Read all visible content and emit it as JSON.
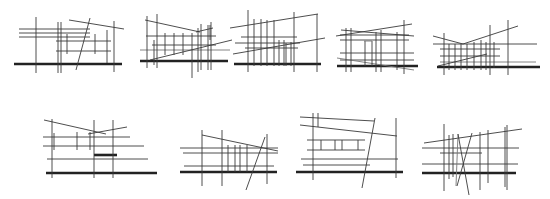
{
  "figure": {
    "width": 550,
    "height": 199,
    "background": "#ffffff",
    "panels": [
      {
        "id": "sketch-1",
        "lines": [
          [
            14,
            64,
            122,
            64,
            "thick"
          ],
          [
            19,
            29,
            90,
            29,
            "thin"
          ],
          [
            19,
            33,
            90,
            33,
            "thin"
          ],
          [
            19,
            37,
            90,
            37,
            "thin"
          ],
          [
            56,
            41,
            111,
            41,
            "thin"
          ],
          [
            56,
            51,
            111,
            51,
            "thin"
          ],
          [
            36,
            17,
            36,
            73,
            "thin"
          ],
          [
            58,
            22,
            58,
            73,
            "thin"
          ],
          [
            61,
            22,
            61,
            73,
            "thin"
          ],
          [
            67,
            34,
            67,
            54,
            "thin"
          ],
          [
            95,
            34,
            95,
            54,
            "thin"
          ],
          [
            107,
            30,
            107,
            63,
            "thin"
          ],
          [
            114,
            21,
            114,
            72,
            "thin"
          ],
          [
            69,
            20,
            124,
            29,
            "thin"
          ],
          [
            90,
            18,
            76,
            70,
            "thin"
          ]
        ]
      },
      {
        "id": "sketch-2",
        "lines": [
          [
            140,
            61,
            228,
            61,
            "thick"
          ],
          [
            146,
            36,
            216,
            36,
            "thin"
          ],
          [
            152,
            45,
            216,
            45,
            "thin"
          ],
          [
            140,
            50,
            230,
            50,
            "grey"
          ],
          [
            147,
            16,
            147,
            68,
            "thin"
          ],
          [
            157,
            14,
            157,
            68,
            "thin"
          ],
          [
            154,
            40,
            154,
            65,
            "thin"
          ],
          [
            165,
            33,
            165,
            55,
            "thin"
          ],
          [
            174,
            33,
            174,
            55,
            "thin"
          ],
          [
            183,
            33,
            183,
            55,
            "thin"
          ],
          [
            192,
            33,
            192,
            78,
            "thin"
          ],
          [
            198,
            28,
            198,
            72,
            "thin"
          ],
          [
            201,
            24,
            201,
            70,
            "thin"
          ],
          [
            208,
            25,
            208,
            70,
            "thin"
          ],
          [
            211,
            22,
            211,
            70,
            "thin"
          ],
          [
            210,
            25,
            210,
            40,
            "thin"
          ],
          [
            145,
            20,
            200,
            32,
            "thin"
          ],
          [
            196,
            32,
            213,
            28,
            "thin"
          ],
          [
            150,
            60,
            232,
            40,
            "thin"
          ]
        ]
      },
      {
        "id": "sketch-3",
        "lines": [
          [
            234,
            64,
            321,
            64,
            "thick"
          ],
          [
            230,
            28,
            318,
            14,
            "thin"
          ],
          [
            233,
            54,
            325,
            38,
            "thin"
          ],
          [
            241,
            37,
            297,
            37,
            "thin"
          ],
          [
            235,
            43,
            300,
            43,
            "thin"
          ],
          [
            245,
            48,
            298,
            48,
            "thin"
          ],
          [
            248,
            10,
            248,
            72,
            "thin"
          ],
          [
            254,
            19,
            254,
            66,
            "thin"
          ],
          [
            261,
            19,
            261,
            66,
            "thin"
          ],
          [
            267,
            20,
            267,
            66,
            "thin"
          ],
          [
            274,
            20,
            274,
            66,
            "thin"
          ],
          [
            279,
            40,
            279,
            66,
            "thin"
          ],
          [
            284,
            40,
            284,
            66,
            "thin"
          ],
          [
            286,
            43,
            286,
            66,
            "thin"
          ],
          [
            291,
            42,
            291,
            66,
            "thin"
          ],
          [
            294,
            12,
            294,
            72,
            "thin"
          ],
          [
            317,
            14,
            317,
            72,
            "thin"
          ]
        ]
      },
      {
        "id": "sketch-4",
        "lines": [
          [
            337,
            66,
            418,
            66,
            "thick"
          ],
          [
            336,
            36,
            412,
            24,
            "thin"
          ],
          [
            341,
            30,
            414,
            36,
            "thin"
          ],
          [
            340,
            35,
            409,
            35,
            "thin"
          ],
          [
            340,
            40,
            409,
            40,
            "thin"
          ],
          [
            340,
            53,
            414,
            53,
            "thin"
          ],
          [
            340,
            60,
            414,
            60,
            "thin"
          ],
          [
            337,
            58,
            414,
            70,
            "grey"
          ],
          [
            346,
            28,
            346,
            72,
            "thin"
          ],
          [
            351,
            28,
            351,
            72,
            "thin"
          ],
          [
            365,
            41,
            365,
            66,
            "thin"
          ],
          [
            372,
            41,
            372,
            66,
            "thin"
          ],
          [
            376,
            32,
            376,
            72,
            "thin"
          ],
          [
            381,
            30,
            381,
            72,
            "thin"
          ],
          [
            397,
            32,
            397,
            70,
            "thin"
          ],
          [
            404,
            20,
            404,
            74,
            "thin"
          ],
          [
            364,
            41,
            372,
            41,
            "grey"
          ]
        ]
      },
      {
        "id": "sketch-5",
        "lines": [
          [
            437,
            67,
            540,
            67,
            "thick"
          ],
          [
            433,
            36,
            463,
            44,
            "thin"
          ],
          [
            463,
            44,
            518,
            26,
            "thin"
          ],
          [
            433,
            44,
            537,
            44,
            "thin"
          ],
          [
            440,
            49,
            500,
            49,
            "thin"
          ],
          [
            440,
            56,
            500,
            56,
            "thin"
          ],
          [
            440,
            62,
            536,
            62,
            "grey"
          ],
          [
            438,
            66,
            487,
            54,
            "thin"
          ],
          [
            444,
            33,
            444,
            75,
            "thin"
          ],
          [
            449,
            44,
            449,
            70,
            "thin"
          ],
          [
            455,
            44,
            455,
            70,
            "thin"
          ],
          [
            461,
            44,
            461,
            70,
            "thin"
          ],
          [
            467,
            44,
            467,
            70,
            "thin"
          ],
          [
            474,
            42,
            474,
            70,
            "thin"
          ],
          [
            481,
            40,
            481,
            70,
            "thin"
          ],
          [
            486,
            42,
            486,
            70,
            "thin"
          ],
          [
            490,
            25,
            490,
            75,
            "thin"
          ],
          [
            494,
            42,
            494,
            68,
            "thin"
          ],
          [
            508,
            20,
            508,
            75,
            "thin"
          ]
        ]
      },
      {
        "id": "sketch-6",
        "lines": [
          [
            46,
            173,
            157,
            173,
            "thick"
          ],
          [
            44,
            120,
            106,
            134,
            "thin"
          ],
          [
            88,
            134,
            127,
            127,
            "thin"
          ],
          [
            43,
            137,
            130,
            137,
            "thin"
          ],
          [
            43,
            146,
            144,
            146,
            "thin"
          ],
          [
            47,
            159,
            148,
            159,
            "thin"
          ],
          [
            94,
            155,
            117,
            155,
            "thick"
          ],
          [
            52,
            119,
            52,
            178,
            "thin"
          ],
          [
            54,
            133,
            54,
            150,
            "thin"
          ],
          [
            77,
            132,
            77,
            150,
            "thin"
          ],
          [
            90,
            132,
            90,
            150,
            "thin"
          ],
          [
            94,
            120,
            94,
            178,
            "thin"
          ],
          [
            113,
            120,
            113,
            178,
            "thin"
          ]
        ]
      },
      {
        "id": "sketch-7",
        "lines": [
          [
            180,
            172,
            277,
            172,
            "thick"
          ],
          [
            202,
            135,
            278,
            151,
            "thin"
          ],
          [
            180,
            148,
            278,
            148,
            "thin"
          ],
          [
            183,
            153,
            278,
            153,
            "thin"
          ],
          [
            184,
            166,
            274,
            166,
            "thin"
          ],
          [
            202,
            130,
            202,
            186,
            "thin"
          ],
          [
            222,
            130,
            222,
            186,
            "thin"
          ],
          [
            228,
            145,
            228,
            172,
            "thin"
          ],
          [
            235,
            145,
            235,
            172,
            "thin"
          ],
          [
            240,
            145,
            240,
            172,
            "thin"
          ],
          [
            247,
            145,
            247,
            172,
            "thin"
          ],
          [
            265,
            137,
            246,
            190,
            "thin"
          ],
          [
            267,
            134,
            267,
            184,
            "thin"
          ]
        ]
      },
      {
        "id": "sketch-8",
        "lines": [
          [
            296,
            172,
            403,
            172,
            "thick"
          ],
          [
            300,
            117,
            374,
            121,
            "thin"
          ],
          [
            300,
            125,
            397,
            136,
            "thin"
          ],
          [
            307,
            140,
            365,
            140,
            "thin"
          ],
          [
            307,
            150,
            365,
            150,
            "thin"
          ],
          [
            301,
            159,
            398,
            159,
            "thin"
          ],
          [
            303,
            165,
            370,
            165,
            "thin"
          ],
          [
            313,
            113,
            313,
            180,
            "thin"
          ],
          [
            318,
            113,
            318,
            127,
            "thin"
          ],
          [
            321,
            140,
            321,
            150,
            "thin"
          ],
          [
            335,
            140,
            335,
            150,
            "thin"
          ],
          [
            342,
            140,
            342,
            150,
            "thin"
          ],
          [
            358,
            140,
            358,
            150,
            "thin"
          ],
          [
            375,
            118,
            362,
            188,
            "thin"
          ],
          [
            396,
            118,
            396,
            178,
            "thin"
          ]
        ]
      },
      {
        "id": "sketch-9",
        "lines": [
          [
            422,
            173,
            516,
            173,
            "thick"
          ],
          [
            424,
            143,
            522,
            129,
            "thin"
          ],
          [
            422,
            148,
            519,
            148,
            "thin"
          ],
          [
            440,
            153,
            482,
            153,
            "thin"
          ],
          [
            422,
            164,
            518,
            164,
            "thin"
          ],
          [
            444,
            124,
            444,
            191,
            "thin"
          ],
          [
            449,
            135,
            449,
            179,
            "thin"
          ],
          [
            453,
            134,
            453,
            177,
            "thin"
          ],
          [
            458,
            134,
            456,
            186,
            "grey"
          ],
          [
            480,
            132,
            480,
            190,
            "thin"
          ],
          [
            488,
            130,
            488,
            183,
            "thin"
          ],
          [
            505,
            127,
            505,
            187,
            "thin"
          ],
          [
            507,
            125,
            507,
            190,
            "thin"
          ],
          [
            458,
            134,
            469,
            195,
            "thin"
          ],
          [
            472,
            133,
            457,
            186,
            "thin"
          ]
        ]
      }
    ]
  }
}
